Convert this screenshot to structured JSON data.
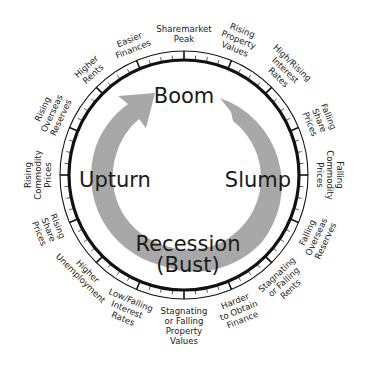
{
  "diagram": {
    "phases": {
      "top": "Boom",
      "right": "Slump",
      "bottom_line1": "Recession",
      "bottom_line2": "(Bust)",
      "left": "Upturn"
    },
    "colors": {
      "ring": "#111111",
      "arrow": "#a8a8a8",
      "text": "#222222"
    },
    "labels": [
      {
        "lines": [
          "Sharemarket",
          "Peak"
        ],
        "angle": 0
      },
      {
        "lines": [
          "Rising",
          "Property",
          "Values"
        ],
        "angle": 22
      },
      {
        "lines": [
          "High/Rising",
          "Interest",
          "Rates"
        ],
        "angle": 44
      },
      {
        "lines": [
          "Falling",
          "Share",
          "Prices"
        ],
        "angle": 68
      },
      {
        "lines": [
          "Falling",
          "Commodity",
          "Prices"
        ],
        "angle": 90
      },
      {
        "lines": [
          "Falling",
          "Overseas",
          "Reserves"
        ],
        "angle": 115
      },
      {
        "lines": [
          "Stagnating",
          "or Falling",
          "Rents"
        ],
        "angle": 137
      },
      {
        "lines": [
          "Harder",
          "to Obtain",
          "Finance"
        ],
        "angle": 158
      },
      {
        "lines": [
          "Stagnating",
          "or Falling",
          "Property",
          "Values"
        ],
        "angle": 180
      },
      {
        "lines": [
          "Low/Falling",
          "Interest",
          "Rates"
        ],
        "angle": 203
      },
      {
        "lines": [
          "Higher",
          "Unemployment"
        ],
        "angle": 225
      },
      {
        "lines": [
          "Rising",
          "Share",
          "Prices"
        ],
        "angle": 248
      },
      {
        "lines": [
          "Rising",
          "Commodity",
          "Prices"
        ],
        "angle": 270
      },
      {
        "lines": [
          "Rising",
          "Overseas",
          "Reserves"
        ],
        "angle": 295
      },
      {
        "lines": [
          "Higher",
          "Rents"
        ],
        "angle": 318
      },
      {
        "lines": [
          "Easier",
          "Finances"
        ],
        "angle": 338
      }
    ]
  }
}
